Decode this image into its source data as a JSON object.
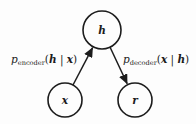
{
  "figure": {
    "colors": {
      "ink": "#1c1c1c",
      "background": "#fdfdfd"
    },
    "nodes": {
      "h": {
        "label": "h"
      },
      "x": {
        "label": "x"
      },
      "r": {
        "label": "r"
      }
    },
    "edges": {
      "encoder": {
        "p": "p",
        "sub": "encoder",
        "open": "(",
        "var1": "h",
        "bar": " | ",
        "var2": "x",
        "close": ")"
      },
      "decoder": {
        "p": "p",
        "sub": "decoder",
        "open": "(",
        "var1": "x",
        "bar": " | ",
        "var2": "h",
        "close": ")"
      }
    }
  }
}
